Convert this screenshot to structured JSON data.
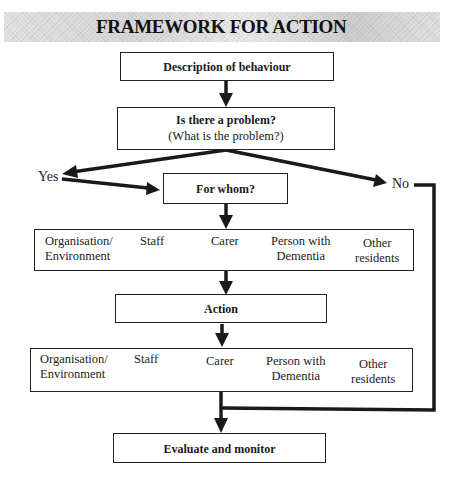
{
  "title": "FRAMEWORK FOR ACTION",
  "nodes": {
    "description": {
      "label": "Description of behaviour"
    },
    "problem": {
      "label": "Is there a problem?",
      "sublabel": "(What is the problem?)"
    },
    "for_whom": {
      "label": "For whom?"
    },
    "action": {
      "label": "Action"
    },
    "evaluate": {
      "label": "Evaluate and monitor"
    }
  },
  "branches": {
    "yes": "Yes",
    "no": "No"
  },
  "category_rows": [
    {
      "id": "who-row",
      "cells": [
        {
          "line1": "Organisation/",
          "line2": "Environment"
        },
        {
          "line1": "Staff",
          "line2": ""
        },
        {
          "line1": "Carer",
          "line2": ""
        },
        {
          "line1": "Person with",
          "line2": "Dementia"
        },
        {
          "line1": "Other",
          "line2": "residents"
        }
      ]
    },
    {
      "id": "action-row",
      "cells": [
        {
          "line1": "Organisation/",
          "line2": "Environment"
        },
        {
          "line1": "Staff",
          "line2": ""
        },
        {
          "line1": "Carer",
          "line2": ""
        },
        {
          "line1": "Person with",
          "line2": "Dementia"
        },
        {
          "line1": "Other",
          "line2": "residents"
        }
      ]
    }
  ],
  "colors": {
    "line": "#1a1a1a",
    "title_band": "#d9d9d9"
  }
}
